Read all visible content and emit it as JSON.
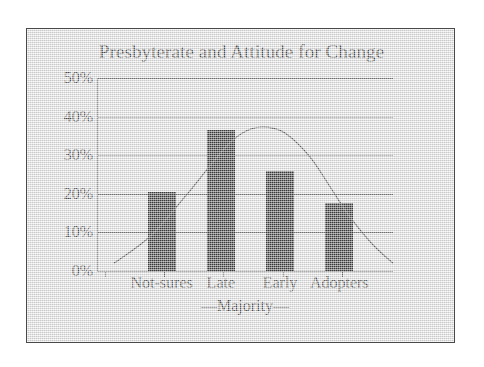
{
  "figure": {
    "frame_border_color": "#4a4a4a",
    "panel_background": "#e8e8e8",
    "page_background": "#ffffff"
  },
  "chart_data": {
    "type": "bar",
    "title": "Presbyterate and Attitude for Change",
    "xlabel": "",
    "ylabel": "",
    "categories": [
      "Not-sures",
      "Late",
      "Early",
      "Adopters"
    ],
    "values": [
      20.5,
      36.5,
      26.0,
      17.5
    ],
    "ylim": [
      0,
      50
    ],
    "yticks": [
      0,
      10,
      20,
      30,
      40,
      50
    ],
    "ytick_labels": [
      "0%",
      "10%",
      "20%",
      "30%",
      "40%",
      "50%"
    ],
    "grid": true,
    "legend": "none",
    "bar_color": "#0b0b0b",
    "group_annotation": "—Majority—",
    "group_annotation_categories": [
      "Late",
      "Early"
    ],
    "series": [
      {
        "name": "Attitude for Change",
        "type": "bar",
        "values": [
          20.5,
          36.5,
          26.0,
          17.5
        ]
      },
      {
        "name": "Normal distribution overlay",
        "type": "line",
        "color": "#3a3a3a",
        "points": [
          {
            "x": 5.7,
            "y": 2.0
          },
          {
            "x": 18.0,
            "y": 9.0
          },
          {
            "x": 30.0,
            "y": 19.5
          },
          {
            "x": 40.0,
            "y": 29.0
          },
          {
            "x": 46.0,
            "y": 34.0
          },
          {
            "x": 52.0,
            "y": 36.8
          },
          {
            "x": 58.0,
            "y": 37.2
          },
          {
            "x": 64.0,
            "y": 35.5
          },
          {
            "x": 72.0,
            "y": 29.5
          },
          {
            "x": 79.0,
            "y": 21.5
          },
          {
            "x": 85.0,
            "y": 14.5
          },
          {
            "x": 93.0,
            "y": 7.0
          },
          {
            "x": 100.0,
            "y": 2.0
          }
        ]
      }
    ]
  },
  "axis": {
    "y_tick_0": "0%",
    "y_tick_1": "10%",
    "y_tick_2": "20%",
    "y_tick_3": "30%",
    "y_tick_4": "40%",
    "y_tick_5": "50%",
    "x_label_0": "Not-sures",
    "x_label_1": "Late",
    "x_label_2": "Early",
    "x_label_3": "Adopters",
    "majority_bracket": "—Majority—"
  }
}
